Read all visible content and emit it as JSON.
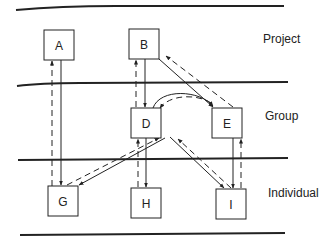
{
  "diagram": {
    "levels": [
      {
        "id": "project",
        "label": "Project"
      },
      {
        "id": "group",
        "label": "Group"
      },
      {
        "id": "individual",
        "label": "Individual"
      }
    ],
    "nodes": [
      {
        "id": "A",
        "label": "A",
        "level": "project"
      },
      {
        "id": "B",
        "label": "B",
        "level": "project"
      },
      {
        "id": "D",
        "label": "D",
        "level": "group"
      },
      {
        "id": "E",
        "label": "E",
        "level": "group"
      },
      {
        "id": "G",
        "label": "G",
        "level": "individual"
      },
      {
        "id": "H",
        "label": "H",
        "level": "individual"
      },
      {
        "id": "I",
        "label": "I",
        "level": "individual"
      }
    ],
    "edges": [
      {
        "from": "A",
        "to": "G",
        "style": "solid"
      },
      {
        "from": "G",
        "to": "A",
        "style": "dashed"
      },
      {
        "from": "B",
        "to": "D",
        "style": "solid"
      },
      {
        "from": "D",
        "to": "B",
        "style": "dashed"
      },
      {
        "from": "B",
        "to": "E",
        "style": "solid"
      },
      {
        "from": "E",
        "to": "B",
        "style": "dashed"
      },
      {
        "from": "D",
        "to": "E",
        "style": "solid",
        "shape": "curved"
      },
      {
        "from": "E",
        "to": "D",
        "style": "dashed",
        "shape": "curved"
      },
      {
        "from": "D",
        "to": "G",
        "style": "solid"
      },
      {
        "from": "G",
        "to": "D",
        "style": "dashed"
      },
      {
        "from": "D",
        "to": "H",
        "style": "solid"
      },
      {
        "from": "H",
        "to": "D",
        "style": "dashed"
      },
      {
        "from": "D",
        "to": "I",
        "style": "solid"
      },
      {
        "from": "I",
        "to": "D",
        "style": "dashed"
      },
      {
        "from": "E",
        "to": "I",
        "style": "solid"
      },
      {
        "from": "I",
        "to": "E",
        "style": "dashed"
      }
    ]
  }
}
